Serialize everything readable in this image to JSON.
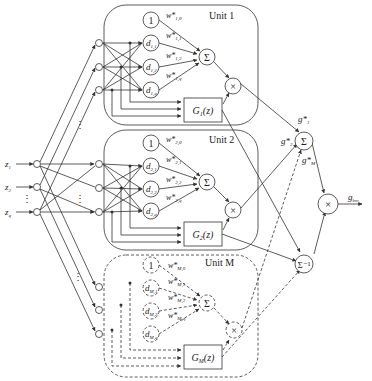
{
  "diagram": {
    "inputs": [
      {
        "label": "z",
        "sub": "1"
      },
      {
        "label": "z",
        "sub": "2"
      },
      {
        "label": "z",
        "sub": "q"
      }
    ],
    "input_ellipsis": "⋮",
    "units": [
      {
        "title": "Unit 1",
        "style": "solid",
        "bias": "1",
        "nodes": [
          {
            "label": "d",
            "sub": "1,1"
          },
          {
            "label": "d",
            "sub": "1,2"
          },
          {
            "label": "d",
            "sub": "1,q"
          }
        ],
        "weights": [
          {
            "label": "w*",
            "sub": "1,0"
          },
          {
            "label": "w*",
            "sub": "1,1"
          },
          {
            "label": "w*",
            "sub": "1,2"
          },
          {
            "label": "w*",
            "sub": "1,q"
          }
        ],
        "sum": "Σ",
        "mult": "×",
        "gate": {
          "label": "G",
          "sub": "1",
          "arg": "(z)"
        }
      },
      {
        "title": "Unit 2",
        "style": "solid",
        "bias": "1",
        "nodes": [
          {
            "label": "d",
            "sub": "2,1"
          },
          {
            "label": "d",
            "sub": "2,2"
          },
          {
            "label": "d",
            "sub": "2,q"
          }
        ],
        "weights": [
          {
            "label": "w*",
            "sub": "2,0"
          },
          {
            "label": "w*",
            "sub": "2,1"
          },
          {
            "label": "w*",
            "sub": "2,2"
          },
          {
            "label": "w*",
            "sub": "2,q"
          }
        ],
        "sum": "Σ",
        "mult": "×",
        "gate": {
          "label": "G",
          "sub": "2",
          "arg": "(z)"
        }
      },
      {
        "title": "Unit M",
        "style": "dashed",
        "bias": "1",
        "nodes": [
          {
            "label": "d",
            "sub": "M,1"
          },
          {
            "label": "d",
            "sub": "M,2"
          },
          {
            "label": "d",
            "sub": "M,q"
          }
        ],
        "weights": [
          {
            "label": "w*",
            "sub": "M,0"
          },
          {
            "label": "w*",
            "sub": "M,1"
          },
          {
            "label": "w*",
            "sub": "M,2"
          },
          {
            "label": "w*",
            "sub": "M,q"
          }
        ],
        "sum": "Σ",
        "mult": "×",
        "gate": {
          "label": "G",
          "sub": "M",
          "arg": "(z)"
        }
      }
    ],
    "output_stage": {
      "sum": "Σ",
      "inv_sum": "Σ⁻¹",
      "mult": "×",
      "g_labels": [
        {
          "label": "g*",
          "sub": "1"
        },
        {
          "label": "g*",
          "sub": "2"
        },
        {
          "label": "g*",
          "sub": "M"
        }
      ],
      "output": {
        "label": "g",
        "sub": "bm"
      }
    }
  }
}
